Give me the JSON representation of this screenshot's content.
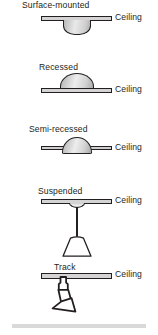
{
  "diagram": {
    "ceiling_label": "Ceiling",
    "colors": {
      "line": "#231f20",
      "ceiling_fill": "#d4d4d4",
      "fixture_light": "#ededed",
      "fixture_dark": "#a8a8a8",
      "floor_strip": "#d9d9d9",
      "background": "#ffffff"
    },
    "fixtures": [
      {
        "id": "surface-mounted",
        "label": "Surface-mounted",
        "ceiling_label": "Ceiling",
        "description": "Fixture body mounted entirely below the ceiling plane"
      },
      {
        "id": "recessed",
        "label": "Recessed",
        "ceiling_label": "Ceiling",
        "description": "Fixture body housed entirely above the ceiling plane"
      },
      {
        "id": "semi-recessed",
        "label": "Semi-recessed",
        "ceiling_label": "Ceiling",
        "description": "Fixture body partly above and partly below the ceiling plane"
      },
      {
        "id": "suspended",
        "label": "Suspended",
        "ceiling_label": "Ceiling",
        "description": "Pendant fixture hung from the ceiling on a stem"
      },
      {
        "id": "track",
        "label": "Track",
        "ceiling_label": "Ceiling",
        "description": "Adjustable spotlight head mounted on a ceiling track"
      }
    ]
  }
}
